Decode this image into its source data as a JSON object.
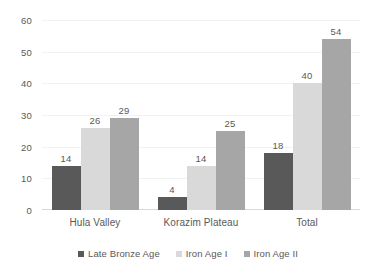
{
  "chart_data": {
    "type": "bar",
    "title": "",
    "subtitle": "",
    "xlabel": "",
    "ylabel": "",
    "categories": [
      "Hula Valley",
      "Korazim Plateau",
      "Total"
    ],
    "series": [
      {
        "name": "Late Bronze Age",
        "color": "#595959",
        "values": [
          14,
          4,
          18
        ]
      },
      {
        "name": "Iron Age I",
        "color": "#d9d9d9",
        "values": [
          26,
          14,
          40
        ]
      },
      {
        "name": "Iron Age II",
        "color": "#a6a6a6",
        "values": [
          29,
          25,
          54
        ]
      }
    ],
    "ylim": [
      0,
      60
    ],
    "yticks": [
      0,
      10,
      20,
      30,
      40,
      50,
      60
    ],
    "ytick_labels": [
      "0",
      "10",
      "20",
      "30",
      "40",
      "50",
      "60"
    ],
    "grid": true,
    "grid_color": "#f2f2f2",
    "legend_position": "bottom",
    "data_labels": true,
    "background": "#ffffff",
    "text_color": "#595959"
  }
}
